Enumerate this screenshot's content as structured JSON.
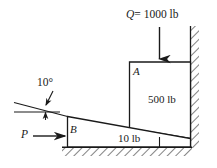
{
  "figure": {
    "background_color": "#ffffff",
    "line_color": "#1a1a1a",
    "labels": {
      "load_q": "Q = 1000 lb",
      "load_q_symbol": "Q",
      "load_q_value": "= 1000 lb",
      "block_a": "A",
      "block_a_weight": "500 lb",
      "block_b": "B",
      "wedge_weight": "10 lb",
      "applied_force": "P",
      "incline_angle": "10°"
    },
    "elements": {
      "wall_name": "fixed-vertical-wall",
      "ground_name": "fixed-ground",
      "arrow_q_direction": "down",
      "arrow_p_direction": "right"
    }
  }
}
